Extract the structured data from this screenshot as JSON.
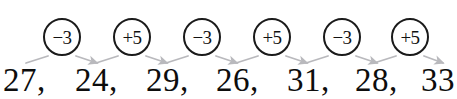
{
  "figure": {
    "kind": "number-sequence-rule-diagram",
    "cropped_text_above": "The rule used is to add 5 and subtract 3",
    "ink_color": "#111111",
    "arrow_color": "#b9b9bd",
    "background_color": "#ffffff"
  },
  "sequence": {
    "terms": [
      {
        "value": "27,",
        "x": 3
      },
      {
        "value": "24,",
        "x": 75
      },
      {
        "value": "29,",
        "x": 146
      },
      {
        "value": "26,",
        "x": 216
      },
      {
        "value": "31,",
        "x": 287
      },
      {
        "value": "28,",
        "x": 355
      },
      {
        "value": "33",
        "x": 421
      }
    ]
  },
  "operations": [
    {
      "label": "−3",
      "sign": "minus",
      "amount": "3",
      "cx": 62,
      "cy": 37
    },
    {
      "label": "+5",
      "sign": "plus",
      "amount": "5",
      "cx": 132,
      "cy": 37
    },
    {
      "label": "−3",
      "sign": "minus",
      "amount": "3",
      "cx": 202,
      "cy": 37
    },
    {
      "label": "+5",
      "sign": "plus",
      "amount": "5",
      "cx": 272,
      "cy": 37
    },
    {
      "label": "−3",
      "sign": "minus",
      "amount": "3",
      "cx": 342,
      "cy": 37
    },
    {
      "label": "+5",
      "sign": "plus",
      "amount": "5",
      "cx": 410,
      "cy": 37
    }
  ],
  "connectors": [
    {
      "from_x": 26,
      "from_y": 63,
      "to_x": 48,
      "to_y": 56,
      "head": false
    },
    {
      "from_x": 76,
      "from_y": 56,
      "to_x": 97,
      "to_y": 63,
      "head": true
    },
    {
      "from_x": 96,
      "from_y": 63,
      "to_x": 118,
      "to_y": 56,
      "head": false
    },
    {
      "from_x": 146,
      "from_y": 56,
      "to_x": 167,
      "to_y": 63,
      "head": true
    },
    {
      "from_x": 166,
      "from_y": 63,
      "to_x": 188,
      "to_y": 56,
      "head": false
    },
    {
      "from_x": 216,
      "from_y": 56,
      "to_x": 237,
      "to_y": 63,
      "head": true
    },
    {
      "from_x": 236,
      "from_y": 63,
      "to_x": 258,
      "to_y": 56,
      "head": false
    },
    {
      "from_x": 286,
      "from_y": 56,
      "to_x": 307,
      "to_y": 63,
      "head": true
    },
    {
      "from_x": 306,
      "from_y": 63,
      "to_x": 328,
      "to_y": 56,
      "head": false
    },
    {
      "from_x": 356,
      "from_y": 56,
      "to_x": 377,
      "to_y": 63,
      "head": true
    },
    {
      "from_x": 374,
      "from_y": 63,
      "to_x": 396,
      "to_y": 56,
      "head": false
    },
    {
      "from_x": 424,
      "from_y": 56,
      "to_x": 443,
      "to_y": 63,
      "head": true
    }
  ]
}
